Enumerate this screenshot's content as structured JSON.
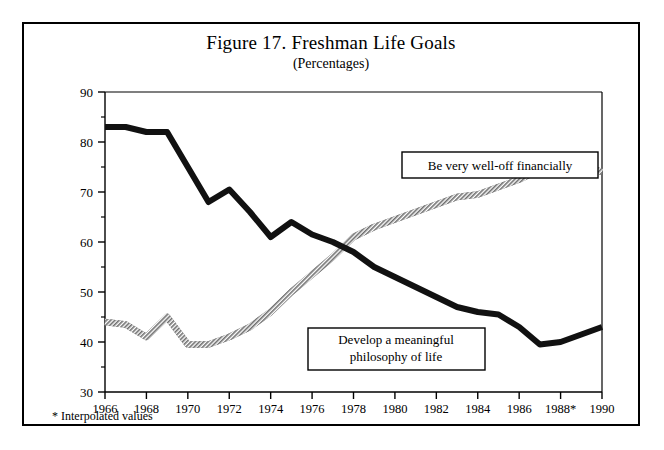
{
  "figure": {
    "title": "Figure 17. Freshman Life Goals",
    "subtitle": "(Percentages)",
    "footnote": "* Interpolated values"
  },
  "annotations": [
    {
      "id": "well-off",
      "label": "Be very well-off financially"
    },
    {
      "id": "philosophy",
      "line1": "Develop a meaningful",
      "line2": "philosophy of life"
    }
  ],
  "colors": {
    "frame": "#000000",
    "axis": "#000000",
    "series_philosophy": "#111111",
    "series_welloff": "#7a7a7a",
    "background": "#ffffff"
  },
  "chart_data": {
    "type": "line",
    "title": "Figure 17. Freshman Life Goals",
    "subtitle": "(Percentages)",
    "xlabel": "",
    "ylabel": "",
    "xlim": [
      1966,
      1990
    ],
    "ylim": [
      30,
      90
    ],
    "ytick_values": [
      30,
      40,
      50,
      60,
      70,
      80,
      90
    ],
    "yminor_values": [
      35,
      45,
      55,
      65,
      75,
      85
    ],
    "xtick_labels": [
      "1966",
      "1968",
      "1970",
      "1972",
      "1974",
      "1976",
      "1978",
      "1980",
      "1982",
      "1984",
      "1986",
      "1988*",
      "1990"
    ],
    "xtick_values": [
      1966,
      1968,
      1970,
      1972,
      1974,
      1976,
      1978,
      1980,
      1982,
      1984,
      1986,
      1988,
      1990
    ],
    "grid": false,
    "legend": "annotated-inline",
    "x": [
      1966,
      1967,
      1968,
      1969,
      1970,
      1971,
      1972,
      1973,
      1974,
      1975,
      1976,
      1977,
      1978,
      1979,
      1980,
      1981,
      1982,
      1983,
      1984,
      1985,
      1986,
      1987,
      1988,
      1989,
      1990
    ],
    "series": [
      {
        "name": "Develop a meaningful philosophy of life",
        "style": "solid-black",
        "values": [
          83,
          83,
          82,
          82,
          75,
          68,
          70.5,
          66,
          61,
          64,
          61.5,
          60,
          58,
          55,
          53,
          51,
          49,
          47,
          46,
          45.5,
          43,
          39.5,
          40,
          41.5,
          43
        ]
      },
      {
        "name": "Be very well-off financially",
        "style": "hatched-gray",
        "values": [
          44,
          43.5,
          41,
          45,
          39.5,
          39.5,
          41,
          43,
          46,
          50,
          53.5,
          57,
          61,
          63,
          64.5,
          66,
          67.5,
          69,
          69.5,
          71,
          72.5,
          74.5,
          75.5,
          75.5,
          74
        ]
      }
    ]
  }
}
